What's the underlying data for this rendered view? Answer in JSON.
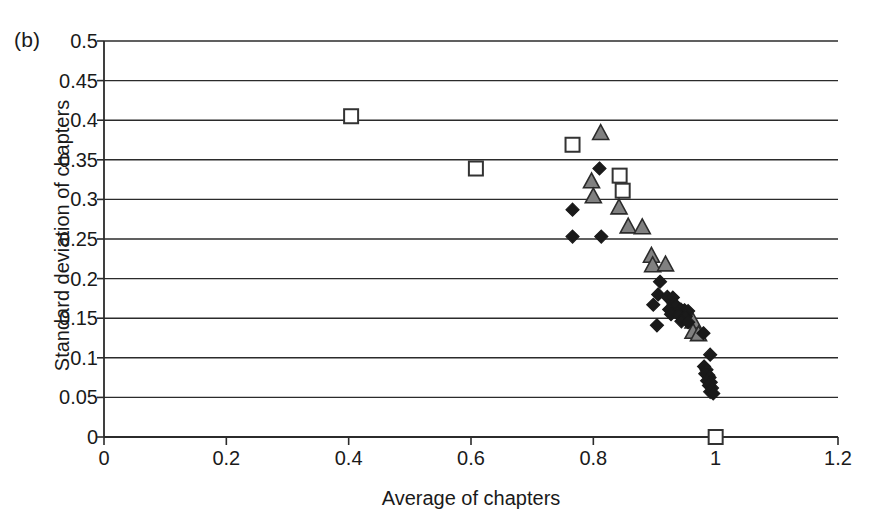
{
  "figure": {
    "panel_label": "(b)"
  },
  "chart_data": {
    "type": "scatter",
    "title": "",
    "xlabel": "Average of chapters",
    "ylabel": "Standard deviation of chapters",
    "xlim": [
      0,
      1.2
    ],
    "ylim": [
      0,
      0.5
    ],
    "xticks": [
      "0",
      "0.2",
      "0.4",
      "0.6",
      "0.8",
      "1",
      "1.2"
    ],
    "xtick_values": [
      0,
      0.2,
      0.4,
      0.6,
      0.8,
      1,
      1.2
    ],
    "yticks": [
      "0",
      "0.05",
      "0.1",
      "0.15",
      "0.2",
      "0.25",
      "0.3",
      "0.35",
      "0.4",
      "0.45",
      "0.5"
    ],
    "ytick_values": [
      0,
      0.05,
      0.1,
      0.15,
      0.2,
      0.25,
      0.3,
      0.35,
      0.4,
      0.45,
      0.5
    ],
    "grid": "horizontal",
    "legend": "none",
    "series": [
      {
        "name": "open-square",
        "marker": "square",
        "fill": "#ffffff",
        "stroke": "#333333",
        "points": [
          [
            0.404,
            0.405
          ],
          [
            0.608,
            0.339
          ],
          [
            0.766,
            0.369
          ],
          [
            0.843,
            0.33
          ],
          [
            0.848,
            0.311
          ],
          [
            1.0,
            0.0
          ]
        ]
      },
      {
        "name": "gray-triangle",
        "marker": "triangle",
        "fill": "#808080",
        "stroke": "#2b2b2b",
        "points": [
          [
            0.812,
            0.385
          ],
          [
            0.797,
            0.324
          ],
          [
            0.8,
            0.305
          ],
          [
            0.842,
            0.291
          ],
          [
            0.857,
            0.267
          ],
          [
            0.88,
            0.266
          ],
          [
            0.895,
            0.23
          ],
          [
            0.897,
            0.218
          ],
          [
            0.918,
            0.219
          ],
          [
            0.963,
            0.147
          ],
          [
            0.963,
            0.134
          ],
          [
            0.972,
            0.131
          ]
        ]
      },
      {
        "name": "black-diamond",
        "marker": "diamond",
        "fill": "#1a1a1a",
        "stroke": "#1a1a1a",
        "points": [
          [
            0.81,
            0.339
          ],
          [
            0.766,
            0.287
          ],
          [
            0.766,
            0.253
          ],
          [
            0.813,
            0.253
          ],
          [
            0.909,
            0.196
          ],
          [
            0.906,
            0.18
          ],
          [
            0.921,
            0.177
          ],
          [
            0.93,
            0.176
          ],
          [
            0.898,
            0.167
          ],
          [
            0.931,
            0.168
          ],
          [
            0.935,
            0.166
          ],
          [
            0.924,
            0.161
          ],
          [
            0.943,
            0.161
          ],
          [
            0.949,
            0.16
          ],
          [
            0.955,
            0.159
          ],
          [
            0.927,
            0.155
          ],
          [
            0.94,
            0.154
          ],
          [
            0.951,
            0.152
          ],
          [
            0.904,
            0.141
          ],
          [
            0.944,
            0.146
          ],
          [
            0.955,
            0.145
          ],
          [
            0.98,
            0.131
          ],
          [
            0.991,
            0.104
          ],
          [
            0.981,
            0.089
          ],
          [
            0.985,
            0.085
          ],
          [
            0.983,
            0.08
          ],
          [
            0.988,
            0.078
          ],
          [
            0.99,
            0.075
          ],
          [
            0.986,
            0.071
          ],
          [
            0.992,
            0.069
          ],
          [
            0.989,
            0.065
          ],
          [
            0.994,
            0.062
          ],
          [
            0.991,
            0.057
          ],
          [
            0.996,
            0.055
          ]
        ]
      }
    ]
  }
}
